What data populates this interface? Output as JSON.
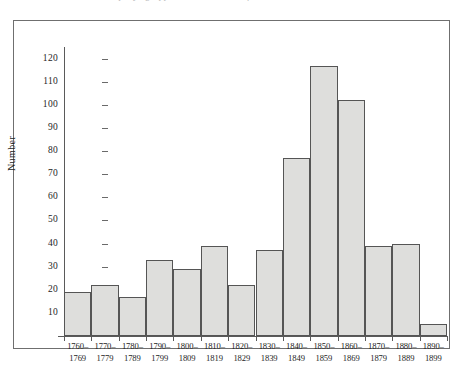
{
  "caption": {
    "clipped_line": "mpany ng Appendix 1: Numbers of ... 1760 and 1899."
  },
  "chart_data": {
    "type": "bar",
    "title": "",
    "subtitle": "",
    "xlabel": "",
    "ylabel": "Number",
    "categories": [
      "1760–\n1769",
      "1770–\n1779",
      "1780–\n1789",
      "1790–\n1799",
      "1800–\n1809",
      "1810–\n1819",
      "1820–\n1829",
      "1830–\n1839",
      "1840–\n1849",
      "1850–\n1859",
      "1860–\n1869",
      "1870–\n1879",
      "1880–\n1889",
      "1890–\n1899"
    ],
    "category_lines": [
      [
        "1760–",
        "1769"
      ],
      [
        "1770–",
        "1779"
      ],
      [
        "1780–",
        "1789"
      ],
      [
        "1790–",
        "1799"
      ],
      [
        "1800–",
        "1809"
      ],
      [
        "1810–",
        "1819"
      ],
      [
        "1820–",
        "1829"
      ],
      [
        "1830–",
        "1839"
      ],
      [
        "1840–",
        "1849"
      ],
      [
        "1850–",
        "1859"
      ],
      [
        "1860–",
        "1869"
      ],
      [
        "1870–",
        "1879"
      ],
      [
        "1880–",
        "1889"
      ],
      [
        "1890–",
        "1899"
      ]
    ],
    "values": [
      19,
      22,
      17,
      33,
      29,
      39,
      22,
      37,
      77,
      117,
      102,
      39,
      40,
      5
    ],
    "ylim": [
      0,
      125
    ],
    "ytick_values": [
      10,
      20,
      30,
      40,
      50,
      60,
      70,
      80,
      90,
      100,
      110,
      120
    ],
    "ytick_labels": [
      "10",
      "20",
      "30",
      "40",
      "50",
      "60",
      "70",
      "80",
      "90",
      "100",
      "110",
      "120"
    ],
    "grid": false,
    "legend": null,
    "legend_position": "none",
    "bar_fill_color": "#dededc",
    "bar_edge_color": "#555555",
    "axis_color": "#5a5a5a",
    "frame_color": "#6f6f6f",
    "text_color": "#1d1d1d",
    "background_color": "#ffffff"
  }
}
